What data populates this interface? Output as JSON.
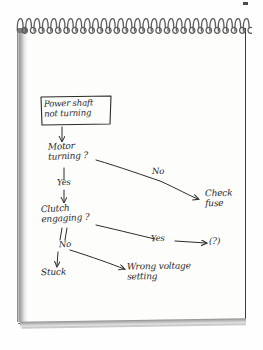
{
  "medium": {
    "surface": "spiral-bound notepad page",
    "ink_color": "#2b2b2b",
    "paper_color": "#fdfdfc",
    "spiral_coil_count": 28
  },
  "diagram": {
    "type": "flowchart",
    "title_box": {
      "line1": "Power shaft",
      "line2": "not turning"
    },
    "nodes": [
      {
        "id": "n1",
        "label": "Power shaft not turning",
        "shape": "rectangle"
      },
      {
        "id": "n2",
        "label_line1": "Motor",
        "label_line2": "turning ?",
        "shape": "text"
      },
      {
        "id": "n3",
        "label_line1": "Clutch",
        "label_line2": "engaging ?",
        "shape": "text"
      },
      {
        "id": "n4",
        "label_line1": "Check",
        "label_line2": "fuse",
        "shape": "text"
      },
      {
        "id": "n5",
        "label": "(?)",
        "shape": "text"
      },
      {
        "id": "n6",
        "label": "Stuck",
        "shape": "text"
      },
      {
        "id": "n7",
        "label_line1": "Wrong voltage",
        "label_line2": "setting",
        "shape": "text"
      }
    ],
    "edge_labels": {
      "motor_yes": "Yes",
      "motor_no": "No",
      "clutch_yes": "Yes",
      "clutch_no": "No"
    },
    "edges": [
      {
        "from": "n1",
        "to": "n2",
        "label": ""
      },
      {
        "from": "n2",
        "to": "n3",
        "label": "Yes"
      },
      {
        "from": "n2",
        "to": "n4",
        "label": "No"
      },
      {
        "from": "n3",
        "to": "n5",
        "label": "Yes"
      },
      {
        "from": "n3",
        "to": "n6",
        "label": "No"
      },
      {
        "from": "n3",
        "to": "n7",
        "label": ""
      }
    ]
  }
}
